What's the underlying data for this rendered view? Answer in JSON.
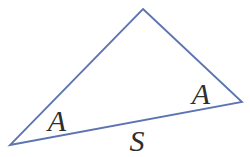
{
  "figure": {
    "background_color": "#ffffff",
    "line_color": "#5d74b2",
    "label_color": "#2e2e2e",
    "triangle": {
      "outline_points": "143,9 242,102 10,145",
      "vertices": {
        "top": {
          "x": 143,
          "y": 9
        },
        "right": {
          "x": 242,
          "y": 102
        },
        "bottom_left": {
          "x": 10,
          "y": 145
        }
      }
    },
    "labels": {
      "angle_left": {
        "text": "A"
      },
      "angle_right": {
        "text": "A"
      },
      "side_bottom": {
        "text": "S"
      }
    }
  }
}
